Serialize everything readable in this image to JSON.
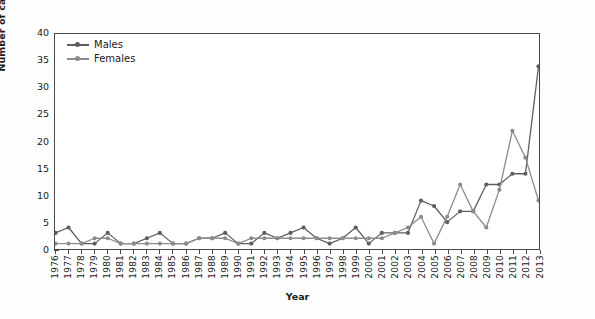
{
  "chart_data": {
    "type": "line",
    "title": "",
    "xlabel": "Year",
    "ylabel": "Number of cases",
    "ylim": [
      0,
      40
    ],
    "ytick_step": 5,
    "yticks": [
      0,
      5,
      10,
      15,
      20,
      25,
      30,
      35,
      40
    ],
    "grid": false,
    "legend_position": "top-left-inside",
    "categories": [
      "1976",
      "1977",
      "1978",
      "1979",
      "1980",
      "1981",
      "1982",
      "1983",
      "1984",
      "1985",
      "1986",
      "1987",
      "1988",
      "1989",
      "1990",
      "1991",
      "1992",
      "1993",
      "1994",
      "1995",
      "1996",
      "1997",
      "1998",
      "1999",
      "2000",
      "2001",
      "2002",
      "2003",
      "2004",
      "2005",
      "2006",
      "2007",
      "2008",
      "2009",
      "2010",
      "2011",
      "2012",
      "2013"
    ],
    "series": [
      {
        "name": "Males",
        "color": "#5e5e5e",
        "values": [
          3,
          4,
          1,
          1,
          3,
          1,
          1,
          2,
          3,
          1,
          1,
          2,
          2,
          3,
          1,
          1,
          3,
          2,
          3,
          4,
          2,
          1,
          2,
          4,
          1,
          3,
          3,
          3,
          9,
          8,
          5,
          7,
          7,
          12,
          12,
          14,
          14,
          34
        ]
      },
      {
        "name": "Females",
        "color": "#8c8c8c",
        "values": [
          1,
          1,
          1,
          2,
          2,
          1,
          1,
          1,
          1,
          1,
          1,
          2,
          2,
          2,
          1,
          2,
          2,
          2,
          2,
          2,
          2,
          2,
          2,
          2,
          2,
          2,
          3,
          4,
          6,
          1,
          6,
          12,
          7,
          4,
          11,
          22,
          17,
          9
        ]
      }
    ]
  },
  "legend": {
    "items": [
      {
        "label": "Males"
      },
      {
        "label": "Females"
      }
    ]
  },
  "axes": {
    "y_title": "Number of cases",
    "x_title": "Year"
  },
  "colors": {
    "males": "#5e5e5e",
    "females": "#8c8c8c",
    "axis": "#4a4a4a",
    "text": "#1a1a1a",
    "plot_background": "#ffffff",
    "page_background": "#fdfdfd"
  }
}
